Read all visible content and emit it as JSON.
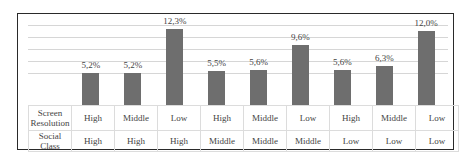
{
  "chart_data": {
    "type": "bar",
    "title": "",
    "xlabel": "",
    "ylabel": "",
    "grid": true,
    "legend": null,
    "ylim": [
      0,
      14
    ],
    "categories": [
      "High/High",
      "Middle/High",
      "Low/High",
      "High/Middle",
      "Middle/Middle",
      "Low/Middle",
      "High/Low",
      "Middle/Low",
      "Low/Low"
    ],
    "values": [
      5.2,
      5.2,
      12.3,
      5.5,
      5.6,
      9.6,
      5.6,
      6.3,
      12.0
    ],
    "data_labels": [
      "5,2%",
      "5,2%",
      "12,3%",
      "5,5%",
      "5,6%",
      "9,6%",
      "5,6%",
      "6,3%",
      "12,0%"
    ],
    "table": {
      "rows": [
        {
          "header": "Screen Resolution",
          "values": [
            "High",
            "Middle",
            "Low",
            "High",
            "Middle",
            "Low",
            "High",
            "Middle",
            "Low"
          ]
        },
        {
          "header": "Social Class",
          "values": [
            "High",
            "High",
            "High",
            "Middle",
            "Middle",
            "Middle",
            "Low",
            "Low",
            "Low"
          ]
        }
      ]
    },
    "bar_color": "#6e6e6e"
  }
}
